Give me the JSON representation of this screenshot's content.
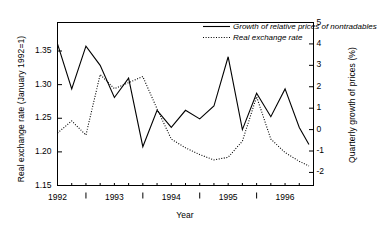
{
  "chart_data": {
    "type": "line",
    "title": "",
    "xlabel": "Year",
    "ylabel": "Real exchange rate (January 1992=1)",
    "ylabel_right": "Quarterly growth of prices (%)",
    "grid": false,
    "legend_position": "top-right",
    "xlim": [
      1992.0,
      1996.5
    ],
    "ylim_left": [
      1.15,
      1.3924
    ],
    "ylim_right": [
      -2.61,
      5.0
    ],
    "xticks_major": [
      "1992",
      "1993",
      "1994",
      "1995",
      "1996"
    ],
    "xticks_major_values": [
      1992.0,
      1993.0,
      1994.0,
      1995.0,
      1996.0
    ],
    "xticks_minor_values": [
      1992.25,
      1992.5,
      1992.75,
      1993.25,
      1993.5,
      1993.75,
      1994.25,
      1994.5,
      1994.75,
      1995.25,
      1995.5,
      1995.75,
      1996.25
    ],
    "xticks_labelled_minor_values": [
      1992.5,
      1993.5,
      1994.5,
      1995.5
    ],
    "yticks_left": [
      "1.15",
      "1.20",
      "1.25",
      "1.30",
      "1.35"
    ],
    "yticks_left_values": [
      1.15,
      1.2,
      1.25,
      1.3,
      1.35
    ],
    "yticks_right": [
      "-2",
      "-1",
      "0",
      "1",
      "2",
      "3",
      "4",
      "5"
    ],
    "yticks_right_values": [
      -2,
      -1,
      0,
      1,
      2,
      3,
      4,
      5
    ],
    "x": [
      1992.0,
      1992.25,
      1992.5,
      1992.75,
      1993.0,
      1993.25,
      1993.5,
      1993.75,
      1994.0,
      1994.25,
      1994.5,
      1994.75,
      1995.0,
      1995.25,
      1995.5,
      1995.75,
      1996.0,
      1996.25,
      1996.42
    ],
    "series": [
      {
        "name": "Growth of relative prices of nontradables",
        "style": "solid",
        "axis": "right",
        "units": "%",
        "values": [
          4.0,
          1.9,
          3.9,
          3.0,
          1.5,
          2.4,
          -0.8,
          0.9,
          0.1,
          0.9,
          0.5,
          1.1,
          3.4,
          0.0,
          1.7,
          0.6,
          1.9,
          0.1,
          -0.7
        ]
      },
      {
        "name": "Real exchange rate",
        "style": "dotted",
        "axis": "left",
        "units": "index (January 1992=1)",
        "values": [
          1.228,
          1.246,
          1.225,
          1.315,
          1.294,
          1.303,
          1.312,
          1.264,
          1.219,
          1.206,
          1.196,
          1.188,
          1.192,
          1.216,
          1.282,
          1.219,
          1.199,
          1.186,
          1.179
        ]
      }
    ]
  },
  "legend": {
    "entries": [
      {
        "label": "Growth of relative prices of nontradables",
        "style": "solid"
      },
      {
        "label": "Real exchange rate",
        "style": "dotted"
      }
    ]
  },
  "axes": {
    "left_title": "Real exchange rate (January 1992=1)",
    "right_title": "Quarterly growth of prices (%)",
    "x_title": "Year"
  },
  "colors": {
    "line": "#000000",
    "axis": "#000000",
    "background": "#ffffff"
  }
}
